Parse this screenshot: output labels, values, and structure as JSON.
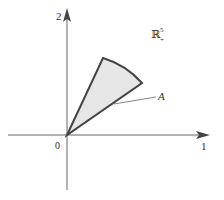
{
  "diagram": {
    "type": "cone-in-positive-orthant",
    "axes": {
      "horizontal_label": "1",
      "vertical_label": "2",
      "origin_label": "0"
    },
    "space_label": {
      "base": "ℝ",
      "superscript": "5",
      "subscript": "+"
    },
    "region_label": "A",
    "colors": {
      "axis": "#555555",
      "region_fill": "#e6e6e6",
      "region_stroke": "#444444",
      "text": "#333333"
    }
  }
}
